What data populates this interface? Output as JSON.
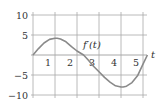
{
  "chart_data": {
    "type": "line",
    "title": "",
    "xlabel": "t",
    "ylabel": "",
    "curve_label": "f′(t)",
    "xlim": [
      0,
      5.2
    ],
    "ylim": [
      -10,
      10
    ],
    "grid": true,
    "legend": null,
    "x_ticks": [
      1,
      2,
      3,
      4,
      5
    ],
    "x_tick_labels": [
      "1",
      "2",
      "3",
      "4",
      "5"
    ],
    "y_ticks": [
      10,
      5,
      0,
      -5,
      -10
    ],
    "y_tick_labels": [
      "10",
      "5",
      "",
      "−5",
      "−10"
    ],
    "series": [
      {
        "name": "f′(t)",
        "color": "#8a8a8a",
        "x": [
          0,
          0.25,
          0.5,
          0.75,
          1.0,
          1.1,
          1.25,
          1.5,
          1.75,
          2.0,
          2.3,
          2.5,
          2.75,
          3.0,
          3.25,
          3.5,
          3.75,
          4.0,
          4.1,
          4.25,
          4.5,
          4.75,
          5.0,
          5.2
        ],
        "y": [
          0,
          1.6,
          3.0,
          3.9,
          4.2,
          4.2,
          4.0,
          3.3,
          2.1,
          1.0,
          0,
          -1.2,
          -2.8,
          -4.2,
          -5.6,
          -6.8,
          -7.7,
          -8.0,
          -8.0,
          -7.8,
          -6.9,
          -5.2,
          -2.3,
          0
        ]
      }
    ]
  },
  "labels": {
    "x_axis": "t",
    "curve": "f′(t)"
  },
  "colors": {
    "grid": "#a8a8a8",
    "curve": "#8a8a8a",
    "text": "#333333"
  }
}
